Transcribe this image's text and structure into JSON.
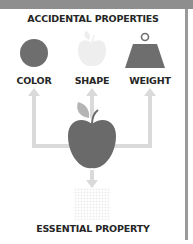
{
  "diagram": {
    "title": "ACCIDENTAL PROPERTIES",
    "properties": [
      {
        "label": "COLOR",
        "icon": "circle-icon"
      },
      {
        "label": "SHAPE",
        "icon": "faded-apple-icon"
      },
      {
        "label": "WEIGHT",
        "icon": "weight-icon"
      }
    ],
    "center_object": "apple-icon",
    "essential": {
      "label": "ESSENTIAL PROPERTY",
      "icon": "grid-square-icon"
    }
  },
  "colors": {
    "frame": "#8e8e8e",
    "icon_dark": "#6e6e6e",
    "arrow": "#d9d9d9",
    "faded": "#eeeeee",
    "text": "#262626"
  }
}
